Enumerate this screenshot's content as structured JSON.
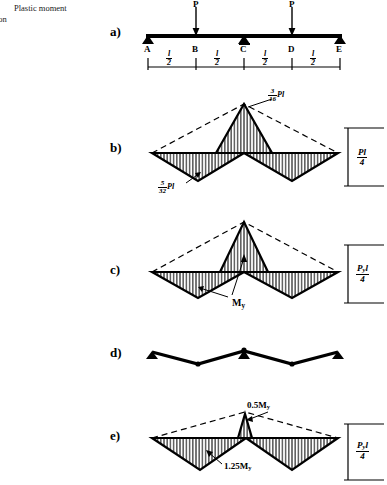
{
  "caption": {
    "line1": "Plastic moment",
    "line2": "ion"
  },
  "panels": [
    {
      "id": "a",
      "label": "a)"
    },
    {
      "id": "b",
      "label": "b)"
    },
    {
      "id": "c",
      "label": "c)"
    },
    {
      "id": "d",
      "label": "d)"
    },
    {
      "id": "e",
      "label": "e)"
    }
  ],
  "beam": {
    "nodes": [
      "A",
      "B",
      "C",
      "D",
      "E"
    ],
    "loads": [
      {
        "at": "B",
        "label": "P"
      },
      {
        "at": "D",
        "label": "P"
      }
    ],
    "supports": [
      "A",
      "C",
      "E"
    ],
    "spans": [
      {
        "num": "l",
        "den": "2"
      },
      {
        "num": "l",
        "den": "2"
      },
      {
        "num": "l",
        "den": "2"
      },
      {
        "num": "l",
        "den": "2"
      }
    ]
  },
  "diagram_b": {
    "peak_label": {
      "num": "3",
      "den": "16",
      "suffix": "Pl"
    },
    "trough_label": {
      "num": "5",
      "den": "32",
      "suffix": "Pl"
    },
    "scale_label": {
      "num": "Pl",
      "den": "4"
    }
  },
  "diagram_c": {
    "annotation": "My",
    "annotation_base": "M",
    "annotation_sub": "y",
    "scale_label": {
      "num": "Pyl",
      "num_base": "P",
      "num_sub": "y",
      "num_tail": "l",
      "den": "4"
    }
  },
  "diagram_e": {
    "peak_label": "0.5My",
    "peak_base": "0.5M",
    "peak_sub": "y",
    "trough_label": "1.25My",
    "trough_base": "1.25M",
    "trough_sub": "y",
    "scale_label": {
      "num_base": "P",
      "num_sub": "y",
      "num_tail": "l",
      "den": "4"
    }
  },
  "colors": {
    "ink": "#000000",
    "hatch": "#1a1a1a",
    "dash": "#000000"
  }
}
